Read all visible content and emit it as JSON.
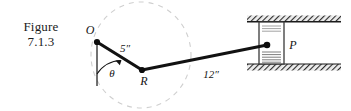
{
  "figure": {
    "caption_lines": [
      "Figure",
      "7.1.3"
    ],
    "caption_full": "Figure 7.1.3"
  },
  "diagram": {
    "type": "mechanism-schematic",
    "points": [
      {
        "id": "O",
        "label": "O",
        "x": 97,
        "y": 42,
        "role": "fixed-pivot"
      },
      {
        "id": "R",
        "label": "R",
        "x": 142,
        "y": 70,
        "role": "crank-pin"
      },
      {
        "id": "P",
        "label": "P",
        "x": 267,
        "y": 45,
        "role": "slider-pin"
      }
    ],
    "links": [
      {
        "id": "OR",
        "from": "O",
        "to": "R",
        "length_label": "5″",
        "length_value": 5,
        "units": "in"
      },
      {
        "id": "RP",
        "from": "R",
        "to": "P",
        "length_label": "12″",
        "length_value": 12,
        "units": "in"
      }
    ],
    "angle": {
      "label": "θ",
      "symbol": "theta",
      "measured_from": "vertical reference line at O",
      "measured_to": "link OR"
    },
    "reference_line": {
      "id": "vertical-datum",
      "from_x": 97,
      "from_y": 42,
      "to_x": 97,
      "to_y": 86
    },
    "dashed_circle": {
      "id": "crank-path",
      "cx": 141,
      "cy": 55,
      "r": 52,
      "style": "dashed",
      "note": "crank circle locus"
    },
    "guides": [
      {
        "id": "top-rail",
        "x": 247,
        "y": 15,
        "width": 94,
        "height": 7,
        "hatched": true
      },
      {
        "id": "bottom-rail",
        "x": 247,
        "y": 64,
        "width": 94,
        "height": 7,
        "hatched": true
      }
    ],
    "slider": {
      "id": "piston-block",
      "label": "P",
      "x": 259,
      "y": 22,
      "width": 25,
      "height": 42,
      "inner_lines_top": 3,
      "inner_lines_bottom": 5
    }
  },
  "colors": {
    "background": "#ffffff",
    "ink": "#141414",
    "link_stroke": "#121212",
    "dashed_faint": "#c9c9c9",
    "hatch": "#2b2b2b",
    "rail_fill": "#e6e6e6",
    "block_stroke": "#3a3a3a"
  }
}
